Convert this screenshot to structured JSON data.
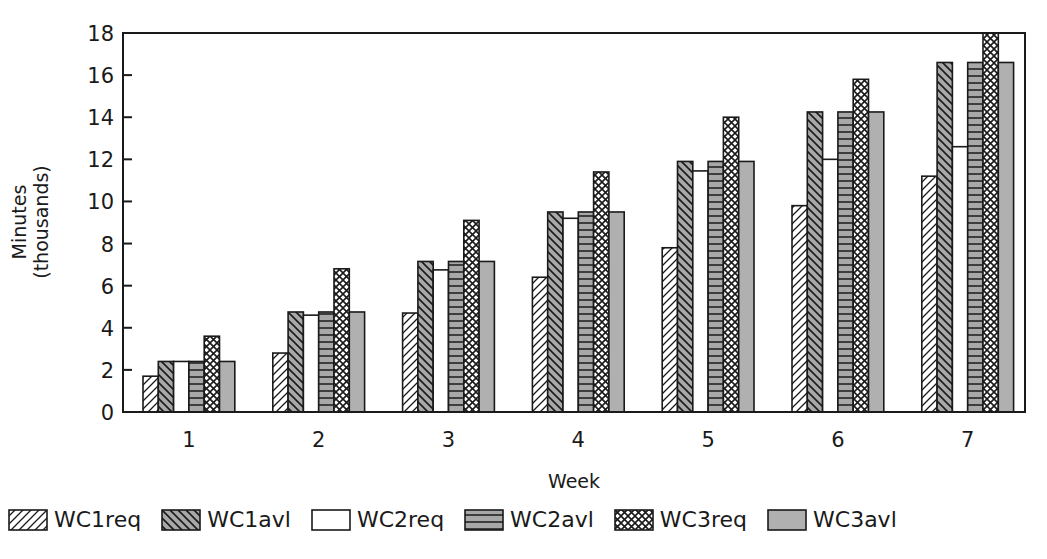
{
  "chart_data": {
    "type": "bar",
    "title": "",
    "xlabel": "Week",
    "ylabel": "Minutes (thousands)",
    "ylabel_lines": [
      "Minutes",
      "(thousands)"
    ],
    "categories": [
      "1",
      "2",
      "3",
      "4",
      "5",
      "6",
      "7"
    ],
    "ylim": [
      0,
      18
    ],
    "yticks": [
      0,
      2,
      4,
      6,
      8,
      10,
      12,
      14,
      16,
      18
    ],
    "grid": false,
    "legend_position": "bottom",
    "series": [
      {
        "name": "WC1req",
        "pattern": "diagonal-up",
        "fill": "#ffffff",
        "values": [
          1.7,
          2.8,
          4.7,
          6.4,
          7.8,
          9.8,
          11.2
        ]
      },
      {
        "name": "WC1avl",
        "pattern": "diagonal-down",
        "fill": "#a8a8a8",
        "values": [
          2.4,
          4.75,
          7.15,
          9.5,
          11.9,
          14.25,
          16.6
        ]
      },
      {
        "name": "WC2req",
        "pattern": "none",
        "fill": "#ffffff",
        "values": [
          2.4,
          4.6,
          6.75,
          9.2,
          11.45,
          12.0,
          12.6
        ]
      },
      {
        "name": "WC2avl",
        "pattern": "horizontal",
        "fill": "#a8a8a8",
        "values": [
          2.4,
          4.75,
          7.15,
          9.5,
          11.9,
          14.25,
          16.6
        ]
      },
      {
        "name": "WC3req",
        "pattern": "crosshatch",
        "fill": "#ffffff",
        "values": [
          3.6,
          6.8,
          9.1,
          11.4,
          14.0,
          15.8,
          18.0
        ]
      },
      {
        "name": "WC3avl",
        "pattern": "solid",
        "fill": "#b0b0b0",
        "values": [
          2.4,
          4.75,
          7.15,
          9.5,
          11.9,
          14.25,
          16.6
        ]
      }
    ]
  },
  "legend": {
    "items": [
      {
        "label": "WC1req",
        "pattern": "diagonal-up"
      },
      {
        "label": "WC1avl",
        "pattern": "diagonal-down"
      },
      {
        "label": "WC2req",
        "pattern": "none"
      },
      {
        "label": "WC2avl",
        "pattern": "horizontal"
      },
      {
        "label": "WC3req",
        "pattern": "crosshatch"
      },
      {
        "label": "WC3avl",
        "pattern": "solid"
      }
    ]
  },
  "colors": {
    "axis": "#1a1a1a",
    "bar_outline": "#1a1a1a",
    "gray_fill": "#a8a8a8",
    "background": "#ffffff"
  }
}
